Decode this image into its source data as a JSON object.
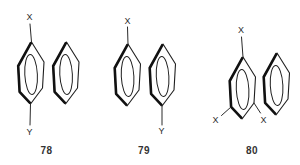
{
  "figure": {
    "background": "#ffffff",
    "line_color": "#1f1f1f",
    "text_color": "#2b2b2b",
    "compounds": [
      {
        "number": "78",
        "substituents": [
          {
            "label": "X",
            "position": "left-ring-top"
          },
          {
            "label": "Y",
            "position": "left-ring-bottom"
          }
        ]
      },
      {
        "number": "79",
        "substituents": [
          {
            "label": "X",
            "position": "left-ring-top"
          },
          {
            "label": "Y",
            "position": "right-ring-bottom"
          }
        ]
      },
      {
        "number": "80",
        "substituents": [
          {
            "label": "X",
            "position": "left-ring-top"
          },
          {
            "label": "X",
            "position": "left-ring-lower-left"
          },
          {
            "label": "X",
            "position": "left-ring-lower-right"
          }
        ]
      }
    ]
  }
}
